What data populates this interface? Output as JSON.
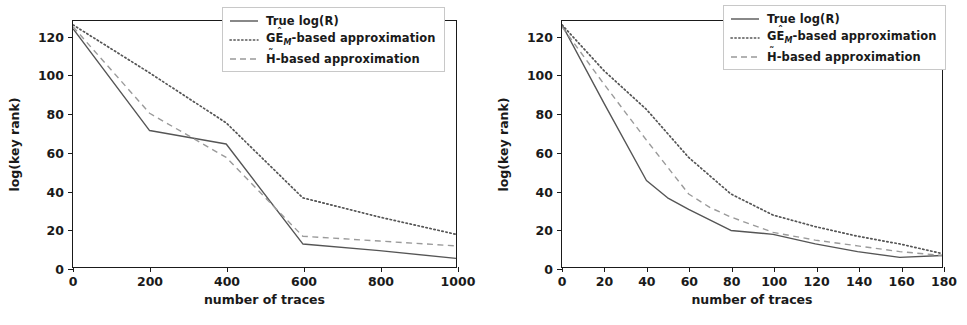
{
  "figure": {
    "panels": [
      "left",
      "right"
    ]
  },
  "legend": {
    "entries": [
      {
        "label": "True log(R)",
        "style": "solid",
        "name": "true-log-r"
      },
      {
        "label": "GÊ",
        "sub": "M",
        "suffix": "-based approximation",
        "style": "dotted",
        "name": "gem-based-approximation"
      },
      {
        "label": "H̃",
        "suffix": "-based approximation",
        "style": "dashed",
        "name": "h-based-approximation"
      }
    ],
    "labels": {
      "true": "True log(R)",
      "ge_prefix": "GÊ",
      "ge_sub": "M",
      "ge_suffix": "-based approximation",
      "h_prefix": "H",
      "h_suffix": "-based approximation"
    }
  },
  "colors": {
    "line": "#555555",
    "axis": "#1a1a1a",
    "legend_border": "#c8c8c8",
    "background": "#ffffff"
  },
  "chart_data": [
    {
      "type": "line",
      "panel": "left",
      "title": "",
      "xlabel": "number of traces",
      "ylabel": "log(key rank)",
      "xlim": [
        0,
        1000
      ],
      "ylim": [
        0,
        128
      ],
      "xticks": [
        0,
        200,
        400,
        600,
        800,
        1000
      ],
      "yticks": [
        0,
        20,
        40,
        60,
        80,
        100,
        120
      ],
      "grid": false,
      "legend_position": "upper right",
      "series": [
        {
          "name": "True log(R)",
          "style": "solid",
          "x": [
            0,
            200,
            400,
            600,
            800,
            1000
          ],
          "values": [
            124,
            71,
            64,
            12,
            8.5,
            4.5
          ]
        },
        {
          "name": "GÊM-based approximation",
          "style": "dotted",
          "x": [
            0,
            200,
            400,
            600,
            800,
            1000
          ],
          "values": [
            126,
            101,
            75,
            36,
            26,
            17
          ]
        },
        {
          "name": "H̃-based approximation",
          "style": "dashed",
          "x": [
            0,
            200,
            400,
            600,
            800,
            1000
          ],
          "values": [
            125,
            80,
            57,
            16,
            13.5,
            11
          ]
        }
      ]
    },
    {
      "type": "line",
      "panel": "right",
      "title": "",
      "xlabel": "number of traces",
      "ylabel": "log(key rank)",
      "xlim": [
        0,
        180
      ],
      "ylim": [
        0,
        128
      ],
      "xticks": [
        0,
        20,
        40,
        60,
        80,
        100,
        120,
        140,
        160,
        180
      ],
      "yticks": [
        0,
        20,
        40,
        60,
        80,
        100,
        120
      ],
      "grid": false,
      "legend_position": "upper right",
      "series": [
        {
          "name": "True log(R)",
          "style": "solid",
          "x": [
            0,
            20,
            40,
            50,
            60,
            80,
            100,
            120,
            140,
            160,
            180
          ],
          "values": [
            126,
            85,
            45,
            36,
            30,
            19,
            17,
            12,
            8,
            5,
            6
          ]
        },
        {
          "name": "GÊM-based approximation",
          "style": "dotted",
          "x": [
            0,
            20,
            40,
            60,
            80,
            100,
            120,
            140,
            160,
            180
          ],
          "values": [
            126,
            102,
            82,
            57,
            38,
            27,
            21,
            16,
            12,
            7
          ]
        },
        {
          "name": "H̃-based approximation",
          "style": "dashed",
          "x": [
            0,
            20,
            40,
            60,
            70,
            80,
            100,
            120,
            140,
            160,
            180
          ],
          "values": [
            125,
            95,
            66,
            38,
            31,
            26,
            18,
            14,
            11,
            8,
            6
          ]
        }
      ]
    }
  ]
}
